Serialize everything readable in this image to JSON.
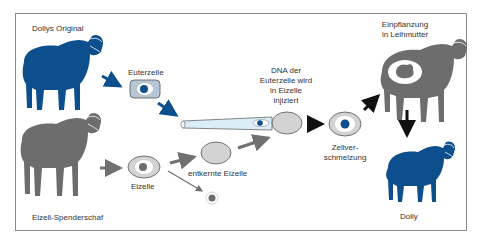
{
  "diagram": {
    "colors": {
      "blue": "#0d4f8c",
      "gray": "#6d6d6d",
      "light_gray": "#d3d3d3",
      "pipette": "#dbeef7",
      "cell_box": "#b7c6d6",
      "frame": "#8a8a8a",
      "arrow_blue": "#0d4f8c",
      "arrow_gray": "#707070",
      "arrow_black": "#111111"
    },
    "labels": {
      "original": "Dollys Original",
      "euterzelle": "Euterzelle",
      "donor": "Eizell-Spenderschaf",
      "eizelle": "Eizelle",
      "entkernte": "entkernte Eizelle",
      "dna_line1": "DNA der",
      "dna_line2": "Euterzelle wird",
      "dna_line3": "in Eizelle",
      "dna_line4": "injiziert",
      "fusion_line1": "Zellver-",
      "fusion_line2": "schmelzung",
      "implant_line1": "Einpflanzung",
      "implant_line2": "in Leihmutter",
      "dolly": "Dolly"
    }
  }
}
